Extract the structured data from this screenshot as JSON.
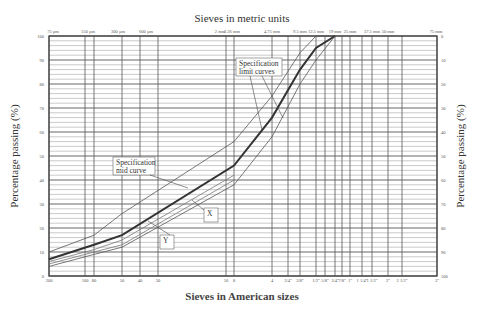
{
  "chart_data": {
    "type": "line",
    "title": "Sieves in metric units",
    "xlabel": "Sieves in American sizes",
    "ylabel": "Percentage passing (%)",
    "ylabel_right": "Percentage passing (%)",
    "ylim": [
      0,
      100
    ],
    "ylim_right": [
      100,
      0
    ],
    "x_scale": "log (sieve size)",
    "grid": true,
    "y_ticks_left": [
      0,
      10,
      20,
      30,
      40,
      50,
      60,
      70,
      80,
      90,
      100
    ],
    "y_ticks_right": [
      0,
      10,
      20,
      30,
      40,
      50,
      60,
      70,
      80,
      90,
      100
    ],
    "x_ticks_top": [
      "75 µm",
      "150 µm",
      "300 µm",
      "600 µm",
      "2 mm",
      "2.36 mm",
      "4.75 mm",
      "9.5 mm",
      "12.5 mm",
      "19 mm",
      "25 mm",
      "37.5 mm",
      "50 mm",
      "75 mm"
    ],
    "x_ticks_bottom": [
      "200",
      "100",
      "80",
      "50",
      "40",
      "30",
      "10",
      "8",
      "4",
      "3/4\"",
      "3/8\"",
      "1/2\"",
      "5/8\"",
      "3/4\"",
      "7/8\"",
      "1\"",
      "1 1/4\"",
      "1 1/2\"",
      "2\"",
      "2 1/2\"",
      "3\""
    ],
    "x": [
      "75 µm",
      "150 µm",
      "300 µm",
      "2.36 mm",
      "4.75 mm",
      "9.5 mm",
      "12.5 mm",
      "19 mm"
    ],
    "series": [
      {
        "name": "Specification upper limit curve",
        "values": [
          10,
          17,
          26,
          56,
          75,
          93,
          100,
          100
        ]
      },
      {
        "name": "Specification mid curve",
        "values": [
          7,
          13,
          17,
          46,
          66,
          86,
          95,
          100
        ]
      },
      {
        "name": "Specification lower limit curve",
        "values": [
          4,
          9,
          12,
          38,
          58,
          80,
          90,
          100
        ]
      },
      {
        "name": "Gradation X",
        "values": [
          6,
          11,
          15,
          42,
          null,
          null,
          null,
          null
        ]
      },
      {
        "name": "Gradation Y",
        "values": [
          5,
          10,
          13,
          40,
          null,
          null,
          null,
          null
        ]
      }
    ],
    "annotations": [
      {
        "text": "Specification limit curves",
        "position": "upper middle"
      },
      {
        "text": "Specification mid curve",
        "position": "left middle"
      },
      {
        "text": "X",
        "position": "lower middle"
      },
      {
        "text": "Y",
        "position": "lower left"
      }
    ],
    "legend": "none (inline callouts)"
  }
}
